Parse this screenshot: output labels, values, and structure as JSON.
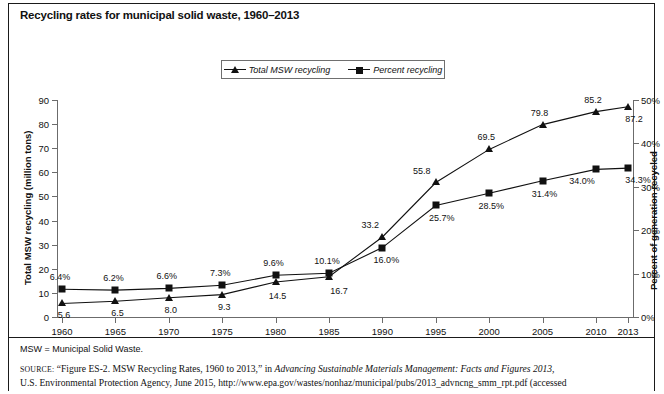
{
  "figure": {
    "title": "Recycling rates for municipal solid waste, 1960–2013",
    "footnote": "MSW = Municipal Solid Waste.",
    "source_label": "SOURCE:",
    "source_text_1": "“Figure ES-2. MSW Recycling Rates, 1960 to 2013,” in ",
    "source_italic_1": "Advancing Sustainable Materials Management: Facts and Figures 2013,",
    "source_text_2": "U.S. Environmental Protection Agency, June 2015, http://www.epa.gov/wastes/nonhaz/municipal/pubs/2013_advncng_smm_rpt.pdf (accessed"
  },
  "legend": {
    "items": [
      {
        "label": "Total MSW recycling",
        "marker": "triangle-marker"
      },
      {
        "label": "Percent recycling",
        "marker": "square-marker"
      }
    ]
  },
  "chart_data": {
    "type": "line",
    "title": "Recycling rates for municipal solid waste, 1960–2013",
    "xlabel": "",
    "categories": [
      "1960",
      "1965",
      "1970",
      "1975",
      "1980",
      "1985",
      "1990",
      "1995",
      "2000",
      "2005",
      "2010",
      "2013"
    ],
    "x": [
      1960,
      1965,
      1970,
      1975,
      1980,
      1985,
      1990,
      1995,
      2000,
      2005,
      2010,
      2013
    ],
    "grid": false,
    "legend_position": "top-center",
    "series": [
      {
        "name": "Total MSW recycling",
        "marker": "triangle",
        "axis": "left",
        "ylabel": "Total MSW recycling (million tons)",
        "ylim": [
          0,
          90
        ],
        "yticks": [
          "0",
          "10",
          "20",
          "30",
          "40",
          "50",
          "60",
          "70",
          "80",
          "90"
        ],
        "values": [
          5.6,
          6.5,
          8.0,
          9.3,
          14.5,
          16.7,
          33.2,
          55.8,
          69.5,
          79.8,
          85.2,
          87.2
        ],
        "data_labels": [
          "5.6",
          "6.5",
          "8.0",
          "9.3",
          "14.5",
          "16.7",
          "33.2",
          "55.8",
          "69.5",
          "79.8",
          "85.2",
          "87.2"
        ]
      },
      {
        "name": "Percent recycling",
        "marker": "square",
        "axis": "right",
        "ylabel": "Percent of generation recycled",
        "ylim": [
          0,
          50
        ],
        "yticks": [
          "0%",
          "10%",
          "20%",
          "30%",
          "40%",
          "50%"
        ],
        "values": [
          6.4,
          6.2,
          6.6,
          7.3,
          9.6,
          10.1,
          16.0,
          25.7,
          28.5,
          31.4,
          34.0,
          34.3
        ],
        "data_labels": [
          "6.4%",
          "6.2%",
          "6.6%",
          "7.3%",
          "9.6%",
          "10.1%",
          "16.0%",
          "25.7%",
          "28.5%",
          "31.4%",
          "34.0%",
          "34.3%"
        ]
      }
    ]
  },
  "colors": {
    "ink": "#111111",
    "axis": "#6b6b6b",
    "frame": "#1a1a1a"
  }
}
